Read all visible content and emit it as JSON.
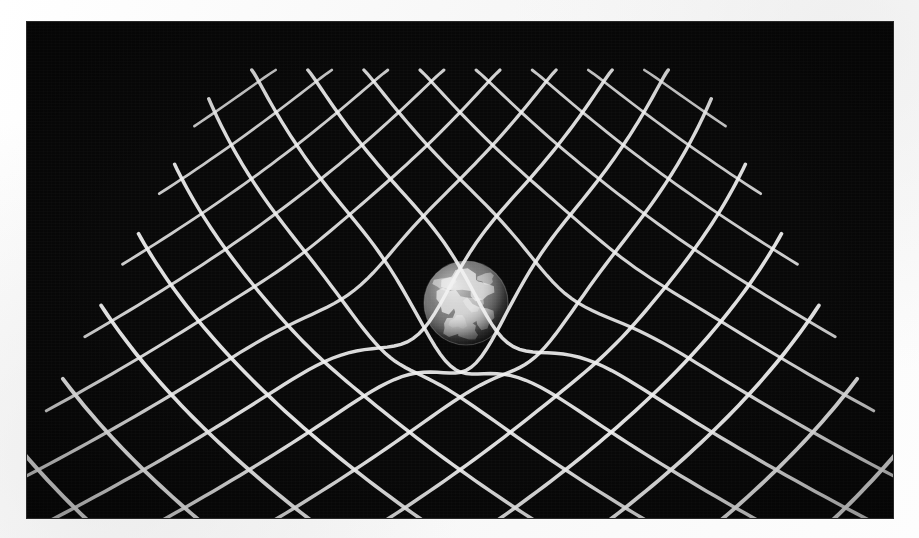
{
  "document": {
    "title": "Spacetime Curvature Diagram",
    "media": "scanned-photograph",
    "page_background": "#fbfbfb"
  },
  "figure": {
    "name": "gravity-well-grid",
    "caption_visible": false,
    "frame": {
      "x": 27,
      "y": 22,
      "width": 866,
      "height": 496,
      "background_color": "#080808",
      "border_color": "#282828"
    },
    "palette": {
      "grid_line": "#f2f2f2",
      "grid_line_dim": "#cfcfcf",
      "void": "#080808",
      "globe_ocean": "#5a5a5a",
      "globe_land": "#dedede",
      "globe_shadow": "#101010",
      "globe_highlight": "#f0f0f0"
    },
    "grid": {
      "type": "perspective-rhombic-lattice",
      "lines_per_direction": 17,
      "direction_a_label": "northeast-running",
      "direction_b_label": "northwest-running",
      "line_width_px": 3.4,
      "horizon_top_y": 48,
      "base_bottom_y": 502,
      "left_extent_x": 28,
      "right_extent_x": 838,
      "warp": {
        "enabled": true,
        "model": "gaussian-well",
        "center_x": 439,
        "center_y": 281,
        "depth_px": 58,
        "radius_px": 132
      }
    },
    "globe": {
      "name": "earth-sphere",
      "center_x": 439,
      "center_y": 281,
      "radius_px": 42,
      "rendering": "grayscale-photographic",
      "continents_visible": true
    }
  },
  "chart_data": {
    "type": "scatter",
    "xlabel": "",
    "ylabel": "",
    "categories": [],
    "values": []
  }
}
